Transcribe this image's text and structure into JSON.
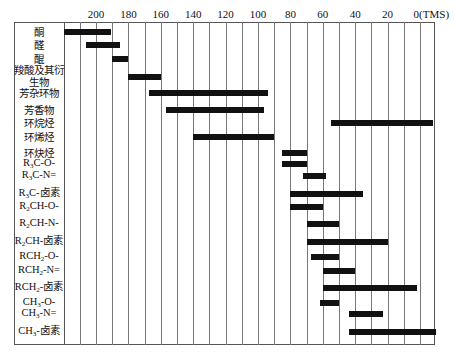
{
  "chart_data": {
    "type": "bar",
    "orientation": "horizontal-range",
    "title": "",
    "xlabel": "",
    "ylabel": "",
    "x_axis": {
      "reversed": true,
      "range": [
        220,
        -10
      ],
      "ticks": [
        200,
        180,
        160,
        140,
        120,
        100,
        80,
        60,
        40,
        20,
        0
      ],
      "tick_labels": [
        "200",
        "180",
        "160",
        "140",
        "120",
        "100",
        "80",
        "60",
        "40",
        "20",
        "0(TMS)"
      ],
      "gridlines_every": 10,
      "grid": true
    },
    "legend": null,
    "categories": [
      "酮",
      "醛",
      "醌",
      "羧酸及其衍生物",
      "芳杂环物",
      "芳香物",
      "环烷烃",
      "环烯烃",
      "环炔烃",
      "R3C-O-",
      "R3C-N=",
      "R3C-卤素",
      "R2CH-O-",
      "R2CH-N-",
      "R2CH-卤素",
      "RCH2-O-",
      "RCH2-N=",
      "RCH2-卤素",
      "CH3-O-",
      "CH3-N=",
      "CH3-卤素"
    ],
    "series": [
      {
        "name": "chemical shift range (ppm)",
        "ranges": [
          [
            220,
            191
          ],
          [
            206,
            185
          ],
          [
            190,
            180
          ],
          [
            180,
            160
          ],
          [
            167,
            94
          ],
          [
            157,
            96
          ],
          [
            55,
            -8
          ],
          [
            140,
            90
          ],
          [
            85,
            70
          ],
          [
            85,
            70
          ],
          [
            72,
            58
          ],
          [
            80,
            35
          ],
          [
            80,
            60
          ],
          [
            70,
            50
          ],
          [
            70,
            20
          ],
          [
            67,
            50
          ],
          [
            60,
            40
          ],
          [
            60,
            2
          ],
          [
            62,
            50
          ],
          [
            44,
            23
          ],
          [
            44,
            -10
          ]
        ]
      }
    ]
  },
  "rows": [
    {
      "label": "酮",
      "sub": "",
      "y": 32
    },
    {
      "label": "醛",
      "sub": "",
      "y": 45
    },
    {
      "label": "醌",
      "sub": "",
      "y": 59
    },
    {
      "label": "羧酸及其衍生物",
      "sub": "",
      "y": 77
    },
    {
      "label": "芳杂环物",
      "sub": "",
      "y": 93
    },
    {
      "label": "芳香物",
      "sub": "",
      "y": 110
    },
    {
      "label": "环烷烃",
      "sub": "",
      "y": 123
    },
    {
      "label": "环烯烃",
      "sub": "",
      "y": 137
    },
    {
      "label": "环炔烃",
      "sub": "",
      "y": 153
    },
    {
      "label": "R3C-O-",
      "y": 164
    },
    {
      "label": "R3C-N=",
      "y": 176
    },
    {
      "label": "R3C-卤素",
      "y": 194
    },
    {
      "label": "R2CH-O-",
      "y": 207
    },
    {
      "label": "R2CH-N-",
      "y": 224
    },
    {
      "label": "R2CH-卤素",
      "y": 242
    },
    {
      "label": "RCH2-O-",
      "y": 257
    },
    {
      "label": "RCH2-N=",
      "y": 271
    },
    {
      "label": "RCH2-卤素",
      "y": 288
    },
    {
      "label": "CH3-O-",
      "y": 303
    },
    {
      "label": "CH3-N=",
      "y": 314
    },
    {
      "label": "CH3-卤素",
      "y": 332
    }
  ]
}
